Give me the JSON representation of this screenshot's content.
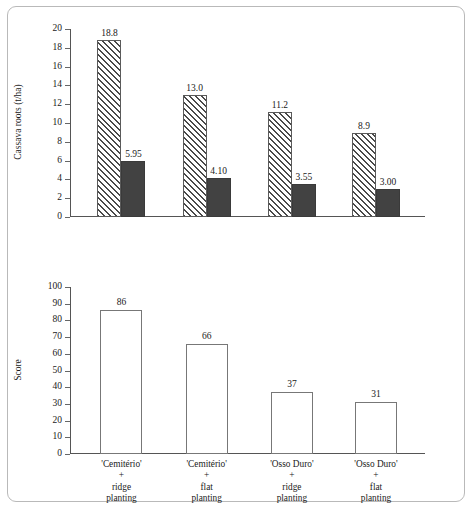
{
  "chart_data": [
    {
      "type": "bar",
      "title": "",
      "xlabel": "",
      "ylabel": "Cassava roots (t/ha)",
      "ylim": [
        0,
        20
      ],
      "ytick_step": 2,
      "yticks": [
        "0",
        "2",
        "4",
        "6",
        "8",
        "10",
        "12",
        "14",
        "16",
        "18",
        "20"
      ],
      "grid": false,
      "legend": "none",
      "categories": [
        "'Cemitério' + ridge planting",
        "'Cemitério' + flat planting",
        "'Osso Duro' + ridge planting",
        "'Osso Duro' + flat planting"
      ],
      "series": [
        {
          "name": "hatched",
          "style": "diagonal-hatch",
          "values": [
            18.8,
            13.0,
            11.2,
            8.9
          ],
          "labels": [
            "18.8",
            "13.0",
            "11.2",
            "8.9"
          ]
        },
        {
          "name": "solid",
          "style": "solid-dark",
          "values": [
            5.95,
            4.1,
            3.55,
            3.0
          ],
          "labels": [
            "5.95",
            "4.10",
            "3.55",
            "3.00"
          ]
        }
      ]
    },
    {
      "type": "bar",
      "title": "",
      "xlabel": "",
      "ylabel": "Score",
      "ylim": [
        0,
        100
      ],
      "ytick_step": 10,
      "yticks": [
        "0",
        "10",
        "20",
        "30",
        "40",
        "50",
        "60",
        "70",
        "80",
        "90",
        "100"
      ],
      "grid": false,
      "legend": "none",
      "categories": [
        "'Cemitério' + ridge planting",
        "'Cemitério' + flat planting",
        "'Osso Duro' + ridge planting",
        "'Osso Duro' + flat planting"
      ],
      "category_lines": [
        [
          "'Cemitério'",
          "+",
          "ridge",
          "planting"
        ],
        [
          "'Cemitério'",
          "+",
          "flat",
          "planting"
        ],
        [
          "'Osso Duro'",
          "+",
          "ridge",
          "planting"
        ],
        [
          "'Osso Duro'",
          "+",
          "flat",
          "planting"
        ]
      ],
      "series": [
        {
          "name": "score",
          "style": "open",
          "values": [
            86,
            66,
            37,
            31
          ],
          "labels": [
            "86",
            "66",
            "37",
            "31"
          ]
        }
      ]
    }
  ],
  "colors": {
    "hatch_line": "#4a4a4a",
    "solid_bar": "#424242",
    "open_bar_border": "#777777",
    "axis": "#555555",
    "frame": "#b9b9b9",
    "text": "#1a1a1a"
  }
}
